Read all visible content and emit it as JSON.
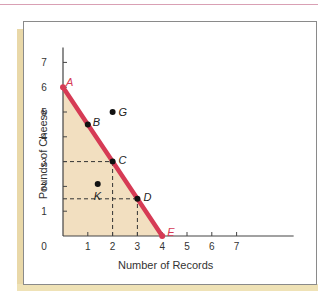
{
  "chart_data": {
    "type": "line",
    "title": "",
    "xlabel": "Number of Records",
    "ylabel": "Pounds of Cheese",
    "xlim": [
      0,
      7
    ],
    "ylim": [
      0,
      7
    ],
    "x_ticks": [
      "0",
      "1",
      "2",
      "3",
      "4",
      "5",
      "6",
      "7"
    ],
    "y_ticks": [
      "1",
      "2",
      "3",
      "4",
      "5",
      "6",
      "7"
    ],
    "grid": false,
    "series": [
      {
        "name": "Production Possibilities Frontier",
        "color": "#d63b55",
        "x": [
          0,
          1,
          2,
          3,
          4
        ],
        "y": [
          6,
          4.5,
          3,
          1.5,
          0
        ]
      }
    ],
    "points": [
      {
        "label": "A",
        "x": 0,
        "y": 6,
        "on_frontier": true
      },
      {
        "label": "B",
        "x": 1,
        "y": 4.5,
        "on_frontier": true
      },
      {
        "label": "C",
        "x": 2,
        "y": 3,
        "on_frontier": true
      },
      {
        "label": "D",
        "x": 3,
        "y": 1.5,
        "on_frontier": true
      },
      {
        "label": "E",
        "x": 4,
        "y": 0,
        "on_frontier": true
      },
      {
        "label": "G",
        "x": 2,
        "y": 5,
        "on_frontier": false
      },
      {
        "label": "K",
        "x": 1.4,
        "y": 2.1,
        "on_frontier": false
      }
    ],
    "guides": [
      {
        "from": [
          0,
          3
        ],
        "to": [
          2,
          3
        ]
      },
      {
        "from": [
          2,
          0
        ],
        "to": [
          2,
          3
        ]
      },
      {
        "from": [
          0,
          1.5
        ],
        "to": [
          3,
          1.5
        ]
      },
      {
        "from": [
          3,
          0
        ],
        "to": [
          3,
          1.5
        ]
      }
    ],
    "feasible_region_color": "#f2dfc0",
    "frontier_color": "#d63b55",
    "label_color_frontier_endpoints": "#d63b55"
  },
  "labels": {
    "xlabel": "Number of Records",
    "ylabel": "Pounds of Cheese"
  }
}
